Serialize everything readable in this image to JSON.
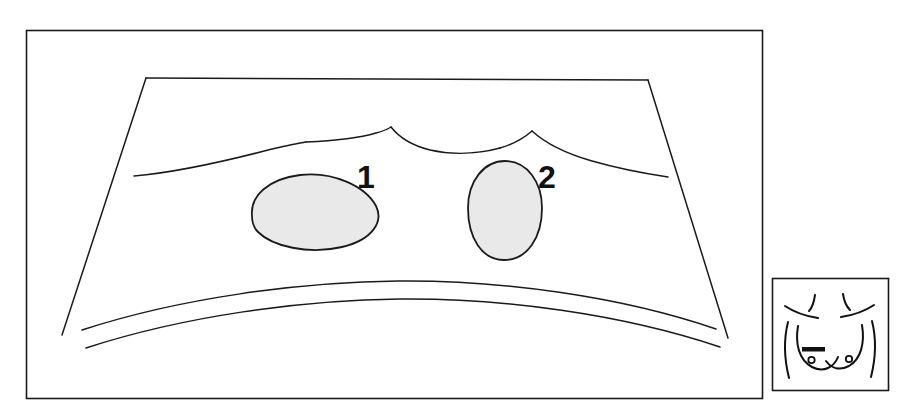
{
  "figure": {
    "kind": "ultrasound-schematic-diagram",
    "background_color": "#ffffff",
    "line_color": "#1a1a1a",
    "lesion_fill_color": "#e8e8e8",
    "lesion_stroke_color": "#1a1a1a"
  },
  "main_panel": {
    "name": "ultrasound-image-frame",
    "border_color": "#1a1a1a",
    "x": 26,
    "y": 30,
    "width": 736,
    "height": 368
  },
  "scan_sector": {
    "name": "scan-sector-outline",
    "top_left": [
      146,
      78
    ],
    "top_right": [
      648,
      80
    ],
    "bottom_left": [
      62,
      335
    ],
    "bottom_right": [
      728,
      338
    ]
  },
  "anatomy": {
    "tissue_plane_curves": [
      {
        "name": "left-tissue-plane",
        "peak_x": 390
      },
      {
        "name": "right-tissue-plane",
        "peak_x": 532
      }
    ],
    "pleural_arcs": [
      {
        "name": "pleural-line-upper"
      },
      {
        "name": "pleural-line-lower"
      }
    ]
  },
  "lesions": [
    {
      "id": 1,
      "name": "lesion-1",
      "label": "1",
      "shape": "flattened-dome-oval",
      "label_x": 370,
      "label_y": 186,
      "center": [
        314,
        212
      ],
      "rx": 64,
      "ry": 38
    },
    {
      "id": 2,
      "name": "lesion-2",
      "label": "2",
      "shape": "egg-ovoid",
      "label_x": 545,
      "label_y": 186,
      "center": [
        505,
        210
      ],
      "rx": 36,
      "ry": 50
    }
  ],
  "inset_panel": {
    "name": "body-marker-inset",
    "border_color": "#1a1a1a",
    "x": 772,
    "y": 278,
    "width": 116,
    "height": 112,
    "content": {
      "description": "anterior-chest-body-marker",
      "transducer_marker": {
        "name": "transducer-position-bar",
        "orientation": "horizontal",
        "color": "#111111"
      },
      "nipple_markers": 2
    }
  }
}
